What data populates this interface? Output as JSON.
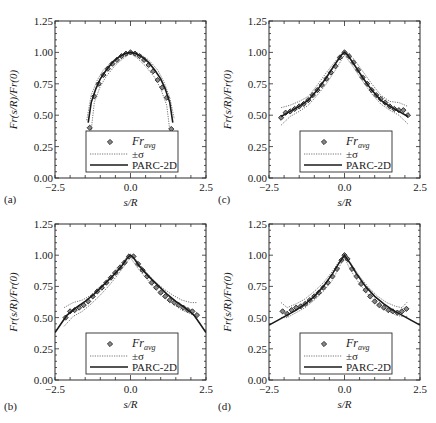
{
  "figure": {
    "panels_order": [
      "a",
      "c",
      "b",
      "d"
    ]
  },
  "chart_data": [
    {
      "panel": "(a)",
      "type": "line",
      "xlabel": "s/R",
      "ylabel": "Fr(s/R)/Fr(0)",
      "xlim": [
        -2.5,
        2.5
      ],
      "ylim": [
        0.0,
        1.25
      ],
      "xticks": [
        "-2.5",
        "0.0",
        "2.5"
      ],
      "yticks": [
        "0.00",
        "0.25",
        "0.50",
        "0.75",
        "1.00",
        "1.25"
      ],
      "legend": [
        "Fr_avg",
        "±σ",
        "PARC-2D"
      ],
      "legend_position": "lower center",
      "series": [
        {
          "name": "Fr_avg",
          "style": "markers",
          "x": [
            -1.35,
            -1.2,
            -1.05,
            -0.9,
            -0.75,
            -0.6,
            -0.45,
            -0.3,
            -0.15,
            0.0,
            0.15,
            0.3,
            0.45,
            0.6,
            0.75,
            0.9,
            1.05,
            1.2,
            1.35
          ],
          "y": [
            0.4,
            0.65,
            0.75,
            0.82,
            0.87,
            0.91,
            0.94,
            0.97,
            0.99,
            1.0,
            0.99,
            0.97,
            0.94,
            0.9,
            0.85,
            0.78,
            0.72,
            0.64,
            0.39
          ]
        },
        {
          "name": "+σ",
          "style": "dotted",
          "x": [
            -1.45,
            -1.3,
            -1.1,
            -0.9,
            -0.6,
            -0.3,
            0.0,
            0.3,
            0.6,
            0.9,
            1.1,
            1.3,
            1.45
          ],
          "y": [
            0.46,
            0.66,
            0.78,
            0.86,
            0.93,
            0.98,
            1.01,
            0.99,
            0.94,
            0.86,
            0.77,
            0.64,
            0.47
          ]
        },
        {
          "name": "-σ",
          "style": "dotted",
          "x": [
            -1.3,
            -1.2,
            -1.0,
            -0.8,
            -0.5,
            -0.2,
            0.0,
            0.2,
            0.5,
            0.8,
            1.0,
            1.2,
            1.3
          ],
          "y": [
            0.38,
            0.6,
            0.73,
            0.81,
            0.9,
            0.96,
            0.99,
            0.96,
            0.89,
            0.8,
            0.71,
            0.58,
            0.38
          ]
        },
        {
          "name": "PARC-2D",
          "style": "solid",
          "x": [
            -1.4,
            -1.3,
            -1.15,
            -1.0,
            -0.8,
            -0.6,
            -0.4,
            -0.2,
            0.0,
            0.2,
            0.4,
            0.6,
            0.8,
            1.0,
            1.15,
            1.3,
            1.4
          ],
          "y": [
            0.44,
            0.6,
            0.71,
            0.79,
            0.86,
            0.92,
            0.96,
            0.99,
            1.0,
            0.99,
            0.96,
            0.92,
            0.86,
            0.79,
            0.71,
            0.6,
            0.44
          ]
        }
      ]
    },
    {
      "panel": "(c)",
      "type": "line",
      "xlabel": "s/R",
      "ylabel": "Fr(s/R)/Fr(0)",
      "xlim": [
        -2.5,
        2.5
      ],
      "ylim": [
        0.0,
        1.25
      ],
      "xticks": [
        "-2.5",
        "0.0",
        "2.5"
      ],
      "yticks": [
        "0.00",
        "0.25",
        "0.50",
        "0.75",
        "1.00",
        "1.25"
      ],
      "legend": [
        "Fr_avg",
        "±σ",
        "PARC-2D"
      ],
      "legend_position": "lower center",
      "series": [
        {
          "name": "Fr_avg",
          "style": "markers",
          "x": [
            -2.1,
            -1.95,
            -1.8,
            -1.65,
            -1.5,
            -1.35,
            -1.2,
            -1.05,
            -0.9,
            -0.75,
            -0.6,
            -0.45,
            -0.3,
            -0.15,
            0.0,
            0.15,
            0.3,
            0.45,
            0.6,
            0.75,
            0.9,
            1.05,
            1.2,
            1.35,
            1.5,
            1.65,
            1.8,
            1.95,
            2.1
          ],
          "y": [
            0.48,
            0.52,
            0.53,
            0.55,
            0.57,
            0.59,
            0.62,
            0.66,
            0.7,
            0.74,
            0.79,
            0.84,
            0.89,
            0.96,
            1.0,
            0.97,
            0.92,
            0.86,
            0.8,
            0.75,
            0.7,
            0.66,
            0.63,
            0.6,
            0.57,
            0.55,
            0.54,
            0.54,
            0.5
          ]
        },
        {
          "name": "+σ",
          "style": "dotted",
          "x": [
            -2.1,
            -1.8,
            -1.5,
            -1.2,
            -0.9,
            -0.6,
            -0.3,
            0.0,
            0.3,
            0.6,
            0.9,
            1.2,
            1.5,
            1.8,
            2.1
          ],
          "y": [
            0.56,
            0.58,
            0.61,
            0.65,
            0.74,
            0.84,
            0.93,
            1.01,
            0.95,
            0.85,
            0.75,
            0.66,
            0.61,
            0.6,
            0.57
          ]
        },
        {
          "name": "-σ",
          "style": "dotted",
          "x": [
            -2.1,
            -1.8,
            -1.5,
            -1.2,
            -0.9,
            -0.6,
            -0.3,
            0.0,
            0.3,
            0.6,
            0.9,
            1.2,
            1.5,
            1.8,
            2.1
          ],
          "y": [
            0.42,
            0.49,
            0.53,
            0.58,
            0.66,
            0.75,
            0.86,
            0.98,
            0.88,
            0.77,
            0.67,
            0.59,
            0.54,
            0.5,
            0.43
          ]
        },
        {
          "name": "PARC-2D",
          "style": "solid",
          "x": [
            -2.1,
            -1.8,
            -1.5,
            -1.2,
            -0.9,
            -0.6,
            -0.3,
            -0.1,
            0.0,
            0.1,
            0.3,
            0.6,
            0.9,
            1.2,
            1.5,
            1.8,
            2.1
          ],
          "y": [
            0.49,
            0.53,
            0.57,
            0.62,
            0.7,
            0.8,
            0.91,
            0.98,
            1.0,
            0.98,
            0.91,
            0.8,
            0.7,
            0.62,
            0.57,
            0.53,
            0.49
          ]
        }
      ]
    },
    {
      "panel": "(b)",
      "type": "line",
      "xlabel": "s/R",
      "ylabel": "Fr(s/R)/Fr(0)",
      "xlim": [
        -2.5,
        2.5
      ],
      "ylim": [
        0.0,
        1.25
      ],
      "xticks": [
        "-2.5",
        "0.0",
        "2.5"
      ],
      "yticks": [
        "0.00",
        "0.25",
        "0.50",
        "0.75",
        "1.00",
        "1.25"
      ],
      "legend": [
        "Fr_avg",
        "±σ",
        "PARC-2D"
      ],
      "legend_position": "lower center",
      "series": [
        {
          "name": "Fr_avg",
          "style": "markers",
          "x": [
            -2.15,
            -2.0,
            -1.85,
            -1.7,
            -1.55,
            -1.4,
            -1.25,
            -1.1,
            -0.95,
            -0.8,
            -0.65,
            -0.5,
            -0.35,
            -0.2,
            -0.05,
            0.1,
            0.25,
            0.4,
            0.55,
            0.7,
            0.85,
            1.0,
            1.15,
            1.3,
            1.45,
            1.6,
            1.75,
            1.9,
            2.05,
            2.2
          ],
          "y": [
            0.5,
            0.55,
            0.56,
            0.58,
            0.6,
            0.63,
            0.67,
            0.71,
            0.74,
            0.78,
            0.82,
            0.86,
            0.9,
            0.94,
            0.99,
            0.99,
            0.93,
            0.88,
            0.83,
            0.78,
            0.74,
            0.7,
            0.67,
            0.64,
            0.62,
            0.6,
            0.58,
            0.56,
            0.55,
            0.52
          ]
        },
        {
          "name": "+σ",
          "style": "dotted",
          "x": [
            -2.2,
            -1.9,
            -1.6,
            -1.3,
            -1.0,
            -0.7,
            -0.4,
            -0.1,
            0.0,
            0.2,
            0.5,
            0.8,
            1.1,
            1.4,
            1.7,
            2.0,
            2.2
          ],
          "y": [
            0.58,
            0.62,
            0.64,
            0.68,
            0.74,
            0.82,
            0.91,
            0.99,
            1.01,
            0.96,
            0.87,
            0.79,
            0.73,
            0.68,
            0.64,
            0.62,
            0.62
          ]
        },
        {
          "name": "-σ",
          "style": "dotted",
          "x": [
            -2.2,
            -1.9,
            -1.6,
            -1.3,
            -1.0,
            -0.7,
            -0.4,
            -0.1,
            0.0,
            0.2,
            0.5,
            0.8,
            1.1,
            1.4,
            1.7,
            2.0,
            2.2
          ],
          "y": [
            0.43,
            0.51,
            0.55,
            0.61,
            0.68,
            0.76,
            0.85,
            0.95,
            0.98,
            0.91,
            0.82,
            0.74,
            0.67,
            0.61,
            0.56,
            0.53,
            0.5
          ]
        },
        {
          "name": "PARC-2D",
          "style": "solid",
          "x": [
            -2.5,
            -2.3,
            -2.1,
            -1.8,
            -1.5,
            -1.2,
            -0.9,
            -0.6,
            -0.3,
            -0.1,
            0.0,
            0.1,
            0.3,
            0.6,
            0.9,
            1.2,
            1.5,
            1.8,
            2.1,
            2.3,
            2.5
          ],
          "y": [
            0.38,
            0.45,
            0.52,
            0.58,
            0.63,
            0.69,
            0.76,
            0.83,
            0.91,
            0.98,
            1.0,
            0.98,
            0.91,
            0.83,
            0.76,
            0.69,
            0.63,
            0.58,
            0.52,
            0.45,
            0.38
          ]
        }
      ]
    },
    {
      "panel": "(d)",
      "type": "line",
      "xlabel": "s/R",
      "ylabel": "Fr(s/R)/Fr(0)",
      "xlim": [
        -2.5,
        2.5
      ],
      "ylim": [
        0.0,
        1.25
      ],
      "xticks": [
        "-2.5",
        "0.0",
        "2.5"
      ],
      "yticks": [
        "0.00",
        "0.25",
        "0.50",
        "0.75",
        "1.00",
        "1.25"
      ],
      "legend": [
        "Fr_avg",
        "±σ",
        "PARC-2D"
      ],
      "legend_position": "lower center",
      "series": [
        {
          "name": "Fr_avg",
          "style": "markers",
          "x": [
            -2.05,
            -1.9,
            -1.75,
            -1.6,
            -1.45,
            -1.3,
            -1.15,
            -1.0,
            -0.85,
            -0.7,
            -0.55,
            -0.4,
            -0.25,
            -0.1,
            0.0,
            0.1,
            0.25,
            0.4,
            0.55,
            0.7,
            0.85,
            1.0,
            1.15,
            1.3,
            1.45,
            1.6,
            1.75,
            1.9,
            2.05
          ],
          "y": [
            0.55,
            0.53,
            0.56,
            0.58,
            0.59,
            0.61,
            0.64,
            0.67,
            0.7,
            0.74,
            0.78,
            0.83,
            0.89,
            0.96,
            1.0,
            0.97,
            0.89,
            0.83,
            0.77,
            0.72,
            0.67,
            0.63,
            0.6,
            0.58,
            0.56,
            0.55,
            0.54,
            0.55,
            0.57
          ]
        },
        {
          "name": "+σ",
          "style": "dotted",
          "x": [
            -2.1,
            -1.9,
            -1.6,
            -1.3,
            -1.0,
            -0.7,
            -0.4,
            -0.1,
            0.0,
            0.2,
            0.5,
            0.8,
            1.1,
            1.4,
            1.7,
            1.9,
            2.1
          ],
          "y": [
            0.62,
            0.58,
            0.61,
            0.65,
            0.71,
            0.78,
            0.87,
            0.98,
            1.01,
            0.94,
            0.83,
            0.74,
            0.67,
            0.62,
            0.59,
            0.58,
            0.63
          ]
        },
        {
          "name": "-σ",
          "style": "dotted",
          "x": [
            -2.1,
            -1.9,
            -1.6,
            -1.3,
            -1.0,
            -0.7,
            -0.4,
            -0.1,
            0.0,
            0.2,
            0.5,
            0.8,
            1.1,
            1.4,
            1.7,
            1.9,
            2.1
          ],
          "y": [
            0.5,
            0.5,
            0.54,
            0.58,
            0.64,
            0.71,
            0.8,
            0.94,
            0.98,
            0.88,
            0.77,
            0.68,
            0.61,
            0.56,
            0.52,
            0.51,
            0.51
          ]
        },
        {
          "name": "PARC-2D",
          "style": "solid",
          "x": [
            -2.5,
            -2.2,
            -1.9,
            -1.6,
            -1.3,
            -1.0,
            -0.7,
            -0.4,
            -0.2,
            0.0,
            0.2,
            0.4,
            0.7,
            1.0,
            1.3,
            1.6,
            1.9,
            2.2,
            2.5
          ],
          "y": [
            0.44,
            0.48,
            0.52,
            0.56,
            0.61,
            0.67,
            0.75,
            0.85,
            0.93,
            1.0,
            0.93,
            0.85,
            0.75,
            0.67,
            0.61,
            0.56,
            0.52,
            0.48,
            0.44
          ]
        }
      ]
    }
  ],
  "legend_labels": {
    "marker": "Fr",
    "marker_sub": "avg",
    "dotted": "±σ",
    "solid": "PARC-2D"
  },
  "colors": {
    "axes": "#2a2a2a",
    "solid_line": "#1a1a1a",
    "dotted_line": "#666666",
    "marker": "#222222"
  }
}
